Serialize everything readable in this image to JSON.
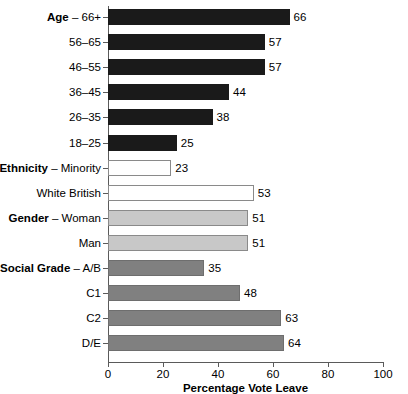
{
  "chart_data": {
    "type": "bar",
    "orientation": "horizontal",
    "title": "",
    "xlabel": "Percentage Vote Leave",
    "ylabel": "",
    "xlim": [
      0,
      100
    ],
    "xticks": [
      0,
      20,
      40,
      60,
      80,
      100
    ],
    "grid": false,
    "legend": null,
    "categories": [
      "Age – 66+",
      "56–65",
      "46–55",
      "36–45",
      "26–35",
      "18–25",
      "Ethnicity – Minority",
      "White British",
      "Gender – Woman",
      "Man",
      "Social Grade – A/B",
      "C1",
      "C2",
      "D/E"
    ],
    "values": [
      66,
      57,
      57,
      44,
      38,
      25,
      23,
      53,
      51,
      51,
      35,
      48,
      63,
      64
    ],
    "bars": [
      {
        "group": "Age",
        "group_bold": "Age",
        "sub": "66+",
        "label_prefix": "Age",
        "label_suffix": "– 66+",
        "value": 66,
        "style": "fill-black"
      },
      {
        "group": "Age",
        "group_bold": "",
        "sub": "56–65",
        "label_prefix": "",
        "label_suffix": "56–65",
        "value": 57,
        "style": "fill-black"
      },
      {
        "group": "Age",
        "group_bold": "",
        "sub": "46–55",
        "label_prefix": "",
        "label_suffix": "46–55",
        "value": 57,
        "style": "fill-black"
      },
      {
        "group": "Age",
        "group_bold": "",
        "sub": "36–45",
        "label_prefix": "",
        "label_suffix": "36–45",
        "value": 44,
        "style": "fill-black"
      },
      {
        "group": "Age",
        "group_bold": "",
        "sub": "26–35",
        "label_prefix": "",
        "label_suffix": "26–35",
        "value": 38,
        "style": "fill-black"
      },
      {
        "group": "Age",
        "group_bold": "",
        "sub": "18–25",
        "label_prefix": "",
        "label_suffix": "18–25",
        "value": 25,
        "style": "fill-black"
      },
      {
        "group": "Ethnicity",
        "group_bold": "Ethnicity",
        "sub": "Minority",
        "label_prefix": "Ethnicity",
        "label_suffix": "– Minority",
        "value": 23,
        "style": "fill-white"
      },
      {
        "group": "Ethnicity",
        "group_bold": "",
        "sub": "White British",
        "label_prefix": "",
        "label_suffix": "White British",
        "value": 53,
        "style": "fill-white"
      },
      {
        "group": "Gender",
        "group_bold": "Gender",
        "sub": "Woman",
        "label_prefix": "Gender",
        "label_suffix": "– Woman",
        "value": 51,
        "style": "fill-lightgray"
      },
      {
        "group": "Gender",
        "group_bold": "",
        "sub": "Man",
        "label_prefix": "",
        "label_suffix": "Man",
        "value": 51,
        "style": "fill-lightgray"
      },
      {
        "group": "Social Grade",
        "group_bold": "Social Grade",
        "sub": "A/B",
        "label_prefix": "Social Grade",
        "label_suffix": "– A/B",
        "value": 35,
        "style": "fill-midgray"
      },
      {
        "group": "Social Grade",
        "group_bold": "",
        "sub": "C1",
        "label_prefix": "",
        "label_suffix": "C1",
        "value": 48,
        "style": "fill-midgray"
      },
      {
        "group": "Social Grade",
        "group_bold": "",
        "sub": "C2",
        "label_prefix": "",
        "label_suffix": "C2",
        "value": 63,
        "style": "fill-midgray"
      },
      {
        "group": "Social Grade",
        "group_bold": "",
        "sub": "D/E",
        "label_prefix": "",
        "label_suffix": "D/E",
        "value": 64,
        "style": "fill-midgray"
      }
    ],
    "colors": {
      "age": "#1a1a1a",
      "ethnicity": "#ffffff",
      "gender": "#c8c8c8",
      "social_grade": "#808080",
      "axis": "#5a5a5a",
      "text": "#000000"
    }
  }
}
